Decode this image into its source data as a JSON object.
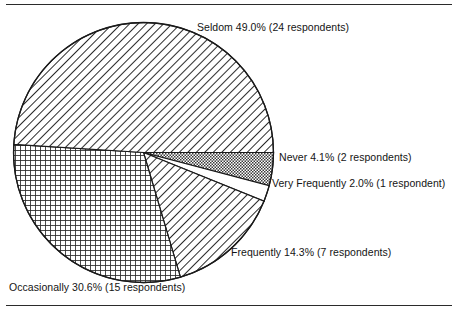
{
  "figure": {
    "name": "survey-frequency-pie-chart",
    "has_top_rule": true,
    "has_bottom_rule": true
  },
  "chart_data": {
    "type": "pie",
    "title": "",
    "subtitle": "",
    "xlabel": "",
    "ylabel": "",
    "legend_position": "none",
    "labels_position": "outside-callout",
    "grid": false,
    "total_respondents": 49,
    "units": "respondents",
    "start_angle_deg": 0,
    "direction": "clockwise",
    "categories": [
      "Never",
      "Very Frequently",
      "Frequently",
      "Occasionally",
      "Seldom"
    ],
    "values": [
      4.1,
      2.0,
      14.3,
      30.6,
      49.0
    ],
    "counts": [
      2,
      1,
      7,
      15,
      24
    ],
    "slices": [
      {
        "name": "never",
        "label": "Never 4.1% (2 respondents)",
        "category": "Never",
        "percent": 4.1,
        "count": 2,
        "count_text": "2 respondents",
        "percent_text": "4.1%",
        "fill": "checker-gray",
        "start_deg": 0.0,
        "end_deg": 14.8
      },
      {
        "name": "very-frequently",
        "label": "Very Frequently 2.0% (1 respondent)",
        "category": "Very Frequently",
        "percent": 2.0,
        "count": 1,
        "count_text": "1 respondent",
        "percent_text": "2.0%",
        "fill": "white",
        "start_deg": 14.8,
        "end_deg": 22.0
      },
      {
        "name": "frequently",
        "label": "Frequently 14.3% (7 respondents)",
        "category": "Frequently",
        "percent": 14.3,
        "count": 7,
        "count_text": "7 respondents",
        "percent_text": "14.3%",
        "fill": "diagonal-hatch",
        "start_deg": 22.0,
        "end_deg": 73.5
      },
      {
        "name": "occasionally",
        "label": "Occasionally 30.6% (15 respondents)",
        "category": "Occasionally",
        "percent": 30.6,
        "count": 15,
        "count_text": "15 respondents",
        "percent_text": "30.6%",
        "fill": "crosshatch-grid",
        "start_deg": 73.5,
        "end_deg": 183.6
      },
      {
        "name": "seldom",
        "label": "Seldom 49.0% (24 respondents)",
        "category": "Seldom",
        "percent": 49.0,
        "count": 24,
        "count_text": "24 respondents",
        "percent_text": "49.0%",
        "fill": "diagonal-hatch",
        "start_deg": 183.6,
        "end_deg": 360.0
      }
    ],
    "colors": {
      "outline": "#1a1a1a",
      "hatch": "#2a2a2a",
      "background": "#ffffff",
      "text": "#141414"
    },
    "geometry": {
      "center_x": 143.5,
      "center_y": 152.5,
      "radius": 130
    }
  }
}
